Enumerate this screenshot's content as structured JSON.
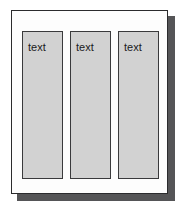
{
  "diagram": {
    "type": "page-layout-schematic",
    "page": {
      "name": "page",
      "background_color": "#fdfdfd",
      "border_color": "#2b2b2d",
      "shadow_color": "#555557"
    },
    "columns": [
      {
        "id": "column-1",
        "label": "text",
        "fill_color": "#d2d2d2",
        "border_color": "#3a3a3c"
      },
      {
        "id": "column-2",
        "label": "text",
        "fill_color": "#d2d2d2",
        "border_color": "#3a3a3c"
      },
      {
        "id": "column-3",
        "label": "text",
        "fill_color": "#d2d2d2",
        "border_color": "#3a3a3c"
      }
    ]
  }
}
